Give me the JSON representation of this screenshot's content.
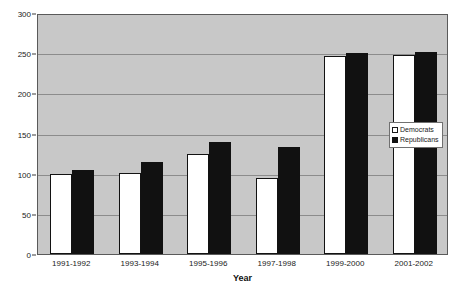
{
  "chart_data": {
    "type": "bar",
    "title": "",
    "xlabel": "Year",
    "ylabel": "",
    "categories": [
      "1991-1992",
      "1993-1994",
      "1995-1996",
      "1997-1998",
      "1999-2000",
      "2001-2002"
    ],
    "series": [
      {
        "name": "Democrats",
        "color": "#ffffff",
        "values": [
          99,
          101,
          125,
          95,
          246,
          248
        ]
      },
      {
        "name": "Republicans",
        "color": "#111111",
        "values": [
          104,
          115,
          140,
          133,
          250,
          251
        ]
      }
    ],
    "ylim": [
      0,
      300
    ],
    "ytick_values": [
      0,
      50,
      100,
      150,
      200,
      250,
      300
    ],
    "ytick_labels": [
      "0",
      "50",
      "100",
      "150",
      "200",
      "250",
      "300"
    ],
    "grid": true,
    "legend_position": "right-middle",
    "plot_background": "#c8c8c8"
  },
  "legend": {
    "items": [
      {
        "label": "Democrats"
      },
      {
        "label": "Republicans"
      }
    ]
  },
  "axis": {
    "x_title": "Year"
  }
}
